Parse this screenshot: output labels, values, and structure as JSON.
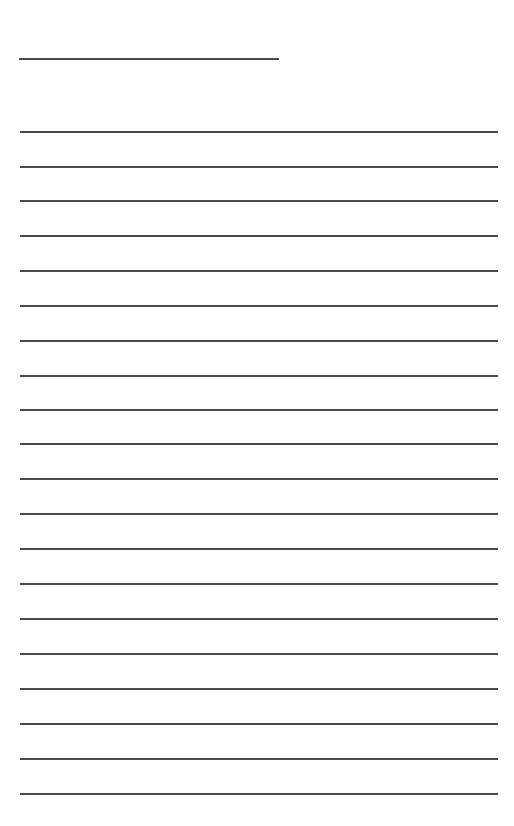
{
  "page": {
    "type": "lined-writing-sheet",
    "background_color": "#ffffff",
    "line_color": "#4a4a4a"
  },
  "title_line": {
    "x": 19,
    "y": 58,
    "width": 260,
    "text": ""
  },
  "writing_lines": [
    {
      "y": 131,
      "text": ""
    },
    {
      "y": 166,
      "text": ""
    },
    {
      "y": 200,
      "text": ""
    },
    {
      "y": 235,
      "text": ""
    },
    {
      "y": 270,
      "text": ""
    },
    {
      "y": 305,
      "text": ""
    },
    {
      "y": 340,
      "text": ""
    },
    {
      "y": 375,
      "text": ""
    },
    {
      "y": 409,
      "text": ""
    },
    {
      "y": 443,
      "text": ""
    },
    {
      "y": 478,
      "text": ""
    },
    {
      "y": 513,
      "text": ""
    },
    {
      "y": 548,
      "text": ""
    },
    {
      "y": 583,
      "text": ""
    },
    {
      "y": 618,
      "text": ""
    },
    {
      "y": 653,
      "text": ""
    },
    {
      "y": 688,
      "text": ""
    },
    {
      "y": 723,
      "text": ""
    },
    {
      "y": 758,
      "text": ""
    },
    {
      "y": 793,
      "text": ""
    }
  ]
}
